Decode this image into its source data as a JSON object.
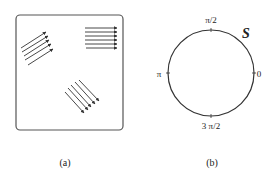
{
  "panels": {
    "a": {
      "caption": "(a)",
      "box": {
        "x": 16,
        "y": 15,
        "width": 107,
        "height": 115,
        "corner_radius": 4
      },
      "arrow_groups": [
        {
          "name": "upper-left",
          "count": 5,
          "direction": "up-right",
          "arrows": [
            {
              "x1": 21,
              "y1": 48,
              "x2": 46,
              "y2": 32
            },
            {
              "x1": 22,
              "y1": 52,
              "x2": 48,
              "y2": 36
            },
            {
              "x1": 24,
              "y1": 56,
              "x2": 49,
              "y2": 40
            },
            {
              "x1": 25,
              "y1": 60,
              "x2": 51,
              "y2": 44
            },
            {
              "x1": 28,
              "y1": 65,
              "x2": 53,
              "y2": 49
            }
          ]
        },
        {
          "name": "upper-right",
          "count": 6,
          "direction": "right",
          "arrows": [
            {
              "x1": 85,
              "y1": 28,
              "x2": 117,
              "y2": 28
            },
            {
              "x1": 85,
              "y1": 32,
              "x2": 117,
              "y2": 32
            },
            {
              "x1": 85,
              "y1": 36,
              "x2": 117,
              "y2": 36
            },
            {
              "x1": 85,
              "y1": 40,
              "x2": 117,
              "y2": 40
            },
            {
              "x1": 85,
              "y1": 44,
              "x2": 117,
              "y2": 44
            },
            {
              "x1": 86,
              "y1": 48,
              "x2": 117,
              "y2": 48
            }
          ]
        },
        {
          "name": "lower-middle",
          "count": 5,
          "direction": "down-right",
          "arrows": [
            {
              "x1": 65,
              "y1": 92,
              "x2": 84,
              "y2": 113
            },
            {
              "x1": 68,
              "y1": 88,
              "x2": 88,
              "y2": 110
            },
            {
              "x1": 71,
              "y1": 85,
              "x2": 91,
              "y2": 107
            },
            {
              "x1": 75,
              "y1": 82,
              "x2": 95,
              "y2": 104
            },
            {
              "x1": 79,
              "y1": 80,
              "x2": 99,
              "y2": 101
            }
          ]
        }
      ]
    },
    "b": {
      "caption": "(b)",
      "set_label": "S",
      "circle": {
        "cx": 211,
        "cy": 73,
        "r": 43
      },
      "angle_labels": {
        "zero": "0",
        "half_pi": "π/2",
        "pi": "π",
        "three_half_pi": "3 π/2"
      }
    }
  },
  "colors": {
    "stroke": "#333333",
    "text": "#222222",
    "background": "#ffffff"
  }
}
